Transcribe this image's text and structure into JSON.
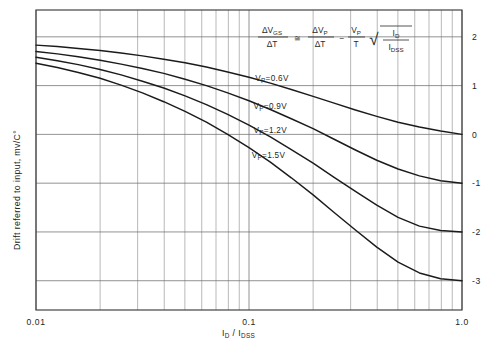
{
  "chart_data": {
    "type": "line",
    "title": "",
    "xlabel": "I_D / I_DSS",
    "xlabel_main": "I",
    "xlabel_sub1": "D",
    "xlabel_mid": " / I",
    "xlabel_sub2": "DSS",
    "ylabel": "Drift referred to input, mv/C°",
    "xscale": "log",
    "xlim": [
      0.01,
      1.0
    ],
    "ylim": [
      -3.6,
      2.55
    ],
    "grid": true,
    "legend": "inline-curve-labels",
    "x_ticks_labeled": [
      "0.01",
      "0.1",
      "1.0"
    ],
    "x_tick_values": [
      0.01,
      0.1,
      1.0
    ],
    "x_minor_ticks": [
      0.02,
      0.03,
      0.04,
      0.05,
      0.06,
      0.07,
      0.08,
      0.09,
      0.2,
      0.3,
      0.4,
      0.5,
      0.6,
      0.7,
      0.8,
      0.9
    ],
    "y_ticks_labeled": [
      "2",
      "1",
      "0",
      "-1",
      "-2",
      "-3"
    ],
    "y_tick_values": [
      2,
      1,
      0,
      -1,
      -2,
      -3
    ],
    "y_axis_side": "right",
    "annotation": {
      "equation_plain": "ΔV_GS/ΔT ≅ ΔV_P/ΔT - (V_P/T)√(I_D/I_DSS)",
      "num1": "ΔV",
      "num1_sub": "GS",
      "den1": "ΔT",
      "rel": "≅",
      "num2": "ΔV",
      "num2_sub": "P",
      "den2": "ΔT",
      "minus": "−",
      "num3": "V",
      "num3_sub": "P",
      "den3": "T",
      "radical": "√",
      "num4": "I",
      "num4_sub": "D",
      "den4": "I",
      "den4_sub": "DSS"
    },
    "series": [
      {
        "name": "Vp=0.6V",
        "label": "V",
        "label_sub": "P",
        "label_rest": "=0.6V",
        "vp": 0.6,
        "label_x": 0.107,
        "label_y": 1.1,
        "x": [
          0.01,
          0.0126,
          0.0158,
          0.02,
          0.0251,
          0.0316,
          0.0398,
          0.0501,
          0.0631,
          0.0794,
          0.1,
          0.126,
          0.158,
          0.2,
          0.251,
          0.316,
          0.398,
          0.501,
          0.631,
          0.794,
          1.0
        ],
        "y": [
          1.83,
          1.8,
          1.76,
          1.72,
          1.67,
          1.61,
          1.54,
          1.47,
          1.38,
          1.28,
          1.17,
          1.05,
          0.92,
          0.78,
          0.64,
          0.5,
          0.37,
          0.25,
          0.15,
          0.07,
          0.0
        ]
      },
      {
        "name": "Vp=0.9V",
        "label": "V",
        "label_sub": "P",
        "label_rest": "=0.9V",
        "vp": 0.9,
        "label_x": 0.105,
        "label_y": 0.52,
        "x": [
          0.01,
          0.0126,
          0.0158,
          0.02,
          0.0251,
          0.0316,
          0.0398,
          0.0501,
          0.0631,
          0.0794,
          0.1,
          0.126,
          0.158,
          0.2,
          0.251,
          0.316,
          0.398,
          0.501,
          0.631,
          0.794,
          1.0
        ],
        "y": [
          1.7,
          1.65,
          1.59,
          1.52,
          1.44,
          1.35,
          1.25,
          1.13,
          1.0,
          0.85,
          0.69,
          0.51,
          0.32,
          0.12,
          -0.1,
          -0.32,
          -0.53,
          -0.71,
          -0.85,
          -0.95,
          -1.0
        ]
      },
      {
        "name": "Vp=1.2V",
        "label": "V",
        "label_sub": "P",
        "label_rest": "=1.2V",
        "vp": 1.2,
        "label_x": 0.105,
        "label_y": 0.02,
        "x": [
          0.01,
          0.0126,
          0.0158,
          0.02,
          0.0251,
          0.0316,
          0.0398,
          0.0501,
          0.0631,
          0.0794,
          0.1,
          0.126,
          0.158,
          0.2,
          0.251,
          0.316,
          0.398,
          0.501,
          0.631,
          0.794,
          1.0
        ],
        "y": [
          1.58,
          1.51,
          1.43,
          1.33,
          1.22,
          1.09,
          0.95,
          0.79,
          0.61,
          0.41,
          0.19,
          -0.05,
          -0.31,
          -0.59,
          -0.88,
          -1.17,
          -1.45,
          -1.7,
          -1.88,
          -1.97,
          -2.0
        ]
      },
      {
        "name": "Vp=1.5V",
        "label": "V",
        "label_sub": "P",
        "label_rest": "=1.5V",
        "vp": 1.5,
        "label_x": 0.103,
        "label_y": -0.48,
        "x": [
          0.01,
          0.0126,
          0.0158,
          0.02,
          0.0251,
          0.0316,
          0.0398,
          0.0501,
          0.0631,
          0.0794,
          0.1,
          0.126,
          0.158,
          0.2,
          0.251,
          0.316,
          0.398,
          0.501,
          0.631,
          0.794,
          1.0
        ],
        "y": [
          1.46,
          1.37,
          1.27,
          1.15,
          1.01,
          0.85,
          0.67,
          0.47,
          0.25,
          0.0,
          -0.27,
          -0.57,
          -0.89,
          -1.24,
          -1.6,
          -1.96,
          -2.31,
          -2.62,
          -2.84,
          -2.96,
          -3.0
        ]
      }
    ]
  }
}
